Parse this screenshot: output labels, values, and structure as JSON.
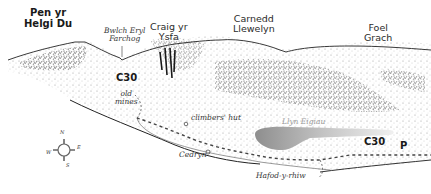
{
  "map": {
    "peaks": [
      {
        "id": "pen-yr-helgi-du",
        "label": "Pen yr\nHelgi Du",
        "line1": "Pen yr",
        "line2": "Helgi Du"
      },
      {
        "id": "bwlch-eryl-farchog",
        "line1": "Bwlch Eryl",
        "line2": "Farchog"
      },
      {
        "id": "craig-yr-ysfa",
        "line1": "Craig yr",
        "line2": "Ysfa"
      },
      {
        "id": "carnedd-llewelyn",
        "line1": "Carnedd",
        "line2": "Llewelyn"
      },
      {
        "id": "foel-grach",
        "line1": "Foel",
        "line2": "Grach"
      }
    ],
    "features": {
      "old_mines": {
        "line1": "old",
        "line2": "mines"
      },
      "climbers_hut": "climbers' hut",
      "lake": "Llyn Eigiau",
      "cedryn": "Cedryn",
      "hafod_y_rhiw": "Hafod-y-rhiw",
      "parking": "P"
    },
    "route_labels": [
      "C30",
      "C30"
    ],
    "compass": {
      "n": "N",
      "s": "S",
      "e": "E",
      "w": "W"
    },
    "colors": {
      "ink": "#2b2b2b",
      "lake": "#9a9a9a",
      "route": "#444444"
    }
  }
}
